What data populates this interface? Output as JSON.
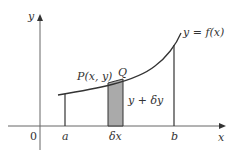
{
  "diagram": {
    "axis_labels": {
      "x": "x",
      "y": "y",
      "origin": "0"
    },
    "tick_labels": {
      "a": "a",
      "b": "b",
      "dx": "δx"
    },
    "curve_label": "y = f(x)",
    "point_p_label": "P(x, y)",
    "point_q_label": "Q",
    "strip_label": "y + δy",
    "colors": {
      "line": "#333333",
      "axis": "#666666",
      "strip": "#aaaaaa"
    }
  }
}
